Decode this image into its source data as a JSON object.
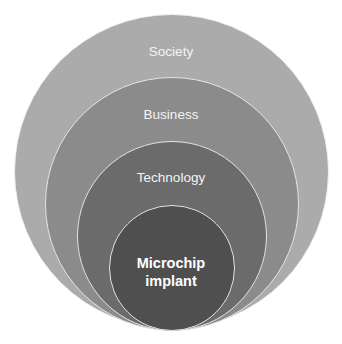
{
  "diagram": {
    "type": "nested-circles",
    "circles": [
      {
        "label": "Society",
        "color": "#ababab",
        "cx": 171.5,
        "cy": 172,
        "r": 157.5
      },
      {
        "label": "Business",
        "color": "#8b8b8b",
        "cx": 171.5,
        "cy": 204,
        "r": 127
      },
      {
        "label": "Technology",
        "color": "#6b6b6b",
        "cx": 171.5,
        "cy": 236,
        "r": 95
      },
      {
        "label": "Microchip implant",
        "color": "#4f4f4f",
        "cx": 171.5,
        "cy": 268,
        "r": 63
      }
    ],
    "labels": {
      "society": "Society",
      "business": "Business",
      "technology": "Technology",
      "microchip_line1": "Microchip",
      "microchip_line2": "implant"
    }
  }
}
